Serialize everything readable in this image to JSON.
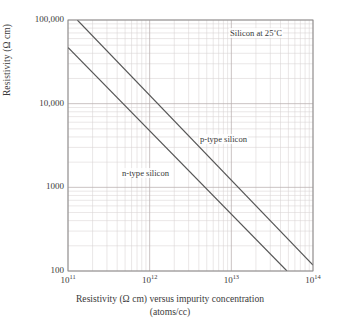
{
  "chart_data": {
    "type": "line",
    "title": "",
    "xlabel": "Resistivity (Ω cm) versus impurity concentration",
    "xlabel_line2": "(atoms/cc)",
    "ylabel": "Resistivity (Ω cm)",
    "xscale": "log",
    "yscale": "log",
    "xlim": [
      100000000000.0,
      100000000000000.0
    ],
    "ylim": [
      100,
      100000
    ],
    "xticklabels": [
      "10¹¹",
      "10¹²",
      "10¹³",
      "10¹⁴"
    ],
    "xtick_base": "10",
    "xtick_exponents": [
      "11",
      "12",
      "13",
      "14"
    ],
    "yticklabels": [
      "100,000",
      "10,000",
      "1000",
      "100"
    ],
    "ytickvalues": [
      100000,
      10000,
      1000,
      100
    ],
    "grid": "both-minor-log",
    "legend": "inline-annotations",
    "annotations": [
      {
        "name": "corner-note",
        "text": "Silicon at 25˚C"
      },
      {
        "name": "p-type-label",
        "text": "p-type silicon"
      },
      {
        "name": "n-type-label",
        "text": "n-type silicon"
      }
    ],
    "series": [
      {
        "name": "p-type silicon",
        "color": "#555555",
        "points": [
          [
            130000000000.0,
            100000
          ],
          [
            100000000000000.0,
            118
          ]
        ]
      },
      {
        "name": "n-type silicon",
        "color": "#555555",
        "points": [
          [
            100000000000.0,
            47000
          ],
          [
            48000000000000.0,
            100
          ]
        ]
      }
    ],
    "colors": {
      "grid_major": "#b9b0b0",
      "grid_minor": "#d8d2d2",
      "axis": "#8a8a8a",
      "line": "#555555",
      "text": "#3a3a3a",
      "background": "#ffffff"
    }
  }
}
